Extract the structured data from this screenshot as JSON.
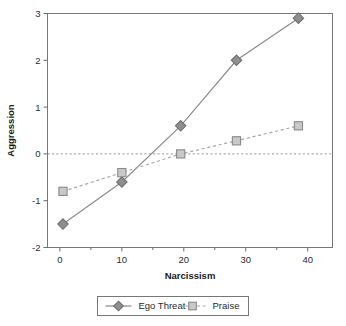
{
  "chart_data": {
    "type": "line",
    "title": "",
    "subtitle": "",
    "xlabel": "Narcissism",
    "ylabel": "Aggression",
    "xlim": [
      -2,
      44
    ],
    "ylim": [
      -2,
      3
    ],
    "x_ticks": [
      0,
      10,
      20,
      30,
      40
    ],
    "x_tick_labels": [
      "0",
      "10",
      "20",
      "30",
      "40"
    ],
    "x_minor_ticks": [
      5,
      15,
      25,
      35
    ],
    "y_ticks": [
      -2,
      -1,
      0,
      1,
      2,
      3
    ],
    "y_tick_labels": [
      "-2",
      "-1",
      "0",
      "1",
      "2",
      "3"
    ],
    "grid": false,
    "legend_position": "below",
    "reference_lines": [
      {
        "axis": "y",
        "value": 0,
        "style": "dashed",
        "color": "#9a9a9a"
      }
    ],
    "x": [
      0.5,
      10,
      19.5,
      28.5,
      38.5
    ],
    "series": [
      {
        "name": "Ego Threat",
        "values": [
          -1.5,
          -0.6,
          0.6,
          2.0,
          2.9
        ],
        "line_style": "solid",
        "marker": "diamond",
        "color": "#8c8c8c",
        "marker_fill": "#8f8f8f",
        "marker_stroke": "#6e6e6e"
      },
      {
        "name": "Praise",
        "values": [
          -0.8,
          -0.4,
          0.0,
          0.28,
          0.6
        ],
        "line_style": "dashed",
        "marker": "square",
        "color": "#a8a8a8",
        "marker_fill": "#c9c9c9",
        "marker_stroke": "#8a8a8a"
      }
    ]
  },
  "legend": {
    "items": [
      {
        "label": "Ego Threat"
      },
      {
        "label": "Praise"
      }
    ]
  },
  "colors": {
    "axis": "#6b6b6b",
    "frame": "#777777",
    "text": "#2b2b2b",
    "reference_line": "#9a9a9a",
    "ego_threat": "#8c8c8c",
    "praise": "#a8a8a8",
    "background": "#ffffff"
  }
}
